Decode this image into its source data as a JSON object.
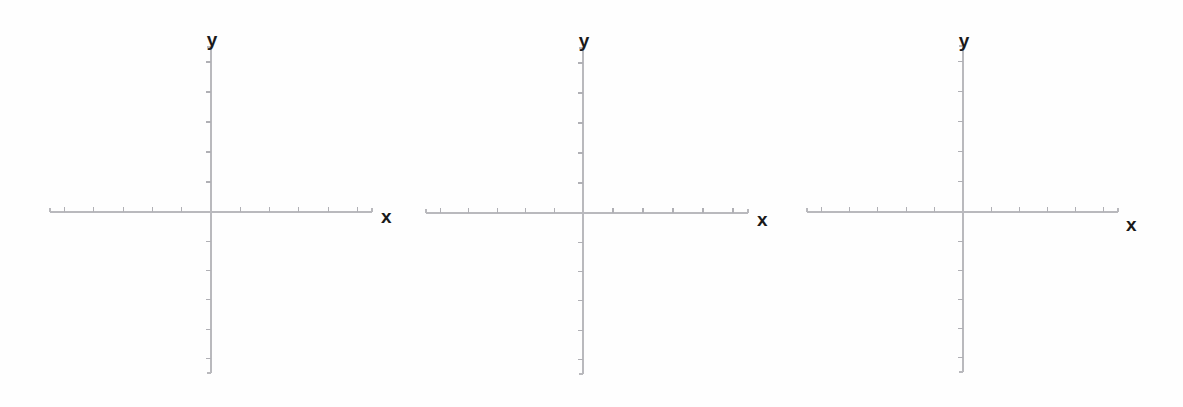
{
  "document": {
    "type": "blank-coordinate-grid-worksheet",
    "background_color": "#ffffff",
    "width": 1183,
    "height": 407,
    "panel_count": 3
  },
  "style": {
    "axis_color": "#b9b9bd",
    "tick_color": "#b0b0b5",
    "label_color": "#1a1a1a",
    "axis_stroke_width": 1.1,
    "tick_stroke_width": 1.1
  },
  "chart_data": {
    "type": "scatter",
    "title": "",
    "subtitle": "",
    "xlabel": "x",
    "ylabel": "y",
    "grid": false,
    "legend": null,
    "series": [],
    "note": "Three empty Cartesian coordinate systems; no data points are plotted.",
    "panels": [
      {
        "name": "coordinate-system-1",
        "origin_px": [
          211,
          212
        ],
        "x_axis_px": [
          50,
          372
        ],
        "y_axis_px": [
          47,
          373
        ],
        "x_ticks": [
          -5,
          -4,
          -3,
          -2,
          -1,
          1,
          2,
          3,
          4,
          5
        ],
        "y_ticks": [
          -5,
          -4,
          -3,
          -2,
          -1,
          1,
          2,
          3,
          4,
          5
        ],
        "xlim": [
          -5.5,
          5.5
        ],
        "ylim": [
          -5.5,
          5.5
        ],
        "x_tick_labels": [],
        "y_tick_labels": [],
        "values": [],
        "x_label": "x",
        "y_label": "y"
      },
      {
        "name": "coordinate-system-2",
        "origin_px": [
          583,
          213
        ],
        "x_axis_px": [
          426,
          748
        ],
        "y_axis_px": [
          48,
          374
        ],
        "x_ticks": [
          -5,
          -4,
          -3,
          -2,
          -1,
          1,
          2,
          3,
          4,
          5
        ],
        "y_ticks": [
          -5,
          -4,
          -3,
          -2,
          -1,
          1,
          2,
          3,
          4,
          5
        ],
        "xlim": [
          -5.5,
          5.5
        ],
        "ylim": [
          -5.5,
          5.5
        ],
        "x_tick_labels": [],
        "y_tick_labels": [],
        "values": [],
        "x_label": "x",
        "y_label": "y"
      },
      {
        "name": "coordinate-system-3",
        "origin_px": [
          963,
          212
        ],
        "x_axis_px": [
          807,
          1118
        ],
        "y_axis_px": [
          46,
          372
        ],
        "x_ticks": [
          -5,
          -4,
          -3,
          -2,
          -1,
          1,
          2,
          3,
          4,
          5
        ],
        "y_ticks": [
          -5,
          -4,
          -3,
          -2,
          -1,
          1,
          2,
          3,
          4,
          5
        ],
        "xlim": [
          -5.5,
          5.5
        ],
        "ylim": [
          -5.5,
          5.5
        ],
        "x_tick_labels": [],
        "y_tick_labels": [],
        "values": [],
        "x_label": "x",
        "y_label": "y"
      }
    ]
  },
  "panels": [
    {
      "x_label": "x",
      "y_label": "y",
      "left": 30,
      "origin_x": 211,
      "origin_y": 212,
      "x_start": 50,
      "x_end": 372,
      "y_top": 47,
      "y_bottom": 373,
      "x_label_left": 381,
      "x_label_top": 216,
      "y_label_left": 212,
      "y_label_top": 30
    },
    {
      "x_label": "x",
      "y_label": "y",
      "left": 406,
      "origin_x": 583,
      "origin_y": 213,
      "x_start": 426,
      "x_end": 748,
      "y_top": 48,
      "y_bottom": 374,
      "x_label_left": 757,
      "x_label_top": 219,
      "y_label_left": 584,
      "y_label_top": 31
    },
    {
      "x_label": "x",
      "y_label": "y",
      "left": 787,
      "origin_x": 963,
      "origin_y": 212,
      "x_start": 807,
      "x_end": 1118,
      "y_top": 46,
      "y_bottom": 372,
      "x_label_left": 1126,
      "x_label_top": 224,
      "y_label_left": 964,
      "y_label_top": 31
    }
  ]
}
